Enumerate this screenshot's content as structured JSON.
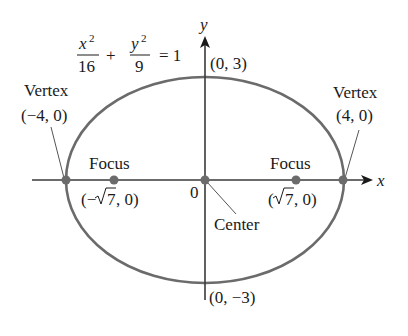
{
  "diagram": {
    "type": "ellipse",
    "equation": {
      "term1_num": "x",
      "term1_exp": "2",
      "term1_den": "16",
      "plus": "+",
      "term2_num": "y",
      "term2_exp": "2",
      "term2_den": "9",
      "equals": "= 1"
    },
    "axes": {
      "x_label": "x",
      "y_label": "y",
      "origin_label": "0"
    },
    "points": {
      "top": "(0, 3)",
      "bottom": "(0, −3)",
      "left_vertex_title": "Vertex",
      "left_vertex_coord": "(−4, 0)",
      "right_vertex_title": "Vertex",
      "right_vertex_coord": "(4, 0)",
      "left_focus_title": "Focus",
      "left_focus_coord_pre": "(−",
      "left_focus_coord_radicand": "7",
      "left_focus_coord_post": ", 0)",
      "right_focus_title": "Focus",
      "right_focus_coord_pre": "(",
      "right_focus_coord_radicand": "7",
      "right_focus_coord_post": ", 0)",
      "center_label": "Center"
    },
    "colors": {
      "ellipse": "#6b6b6b",
      "axis": "#3a3a3a",
      "point": "#6b6b6b",
      "text": "#1a1a1a"
    }
  }
}
